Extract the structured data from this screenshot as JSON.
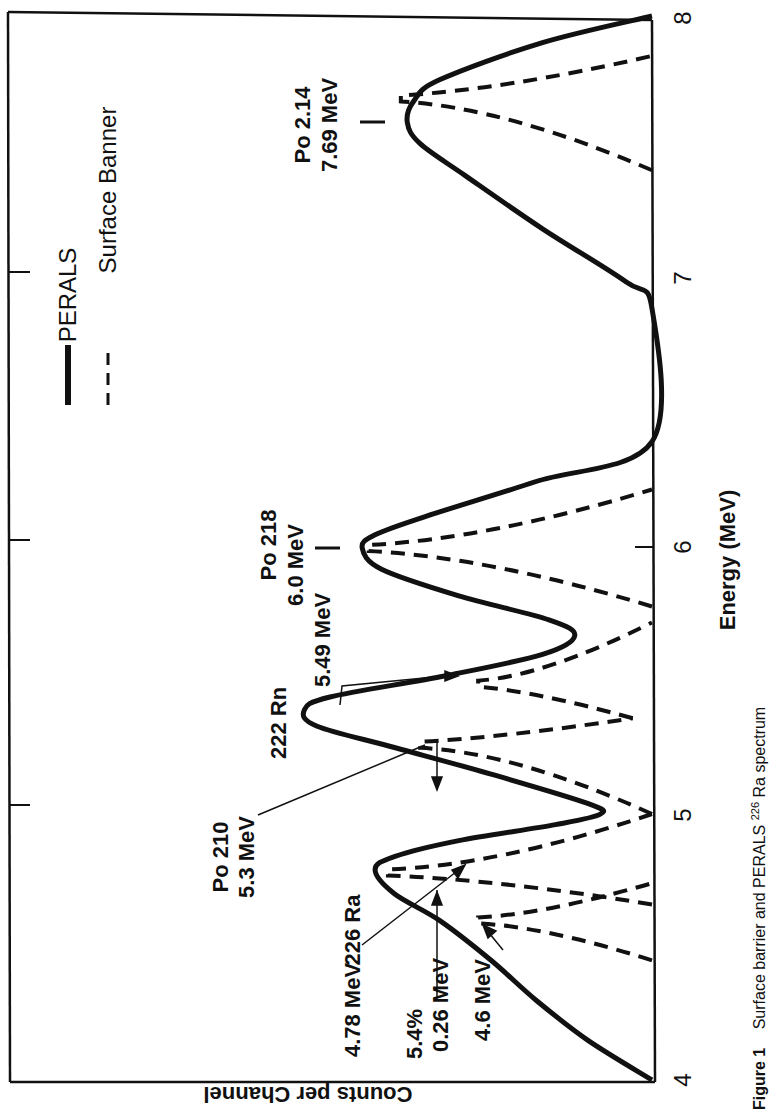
{
  "chart_data": {
    "type": "line",
    "orientation": "rotated-90-ccw",
    "title": "",
    "caption": {
      "figure_label": "Figure 1",
      "text": "Surface barrier and PERALS ",
      "superscript": "226",
      "text_after": "Ra spectrum"
    },
    "xlabel": "Energy (MeV)",
    "ylabel": "Counts per Channel",
    "xlim": [
      4,
      8
    ],
    "ylim": [
      0,
      100
    ],
    "y_units": "relative counts (no numeric ticks shown)",
    "x_ticks": [
      "4",
      "5",
      "6",
      "7",
      "8"
    ],
    "y_ticks_count": 3,
    "grid": false,
    "legend": {
      "position": "upper-left (rotated)",
      "entries": [
        {
          "label": "PERALS",
          "style": "solid"
        },
        {
          "label": "Surface Banner",
          "style": "dashed"
        }
      ]
    },
    "series": [
      {
        "name": "PERALS",
        "style": "solid",
        "points": [
          [
            4.0,
            0
          ],
          [
            4.15,
            10
          ],
          [
            4.3,
            18
          ],
          [
            4.45,
            25
          ],
          [
            4.6,
            33
          ],
          [
            4.7,
            40
          ],
          [
            4.79,
            43
          ],
          [
            4.84,
            40
          ],
          [
            4.9,
            30
          ],
          [
            4.96,
            15
          ],
          [
            5.0,
            8
          ],
          [
            5.04,
            10
          ],
          [
            5.15,
            25
          ],
          [
            5.25,
            40
          ],
          [
            5.33,
            52
          ],
          [
            5.39,
            54
          ],
          [
            5.44,
            50
          ],
          [
            5.52,
            32
          ],
          [
            5.6,
            17
          ],
          [
            5.67,
            12
          ],
          [
            5.73,
            16
          ],
          [
            5.82,
            30
          ],
          [
            5.92,
            42
          ],
          [
            6.0,
            45
          ],
          [
            6.05,
            43
          ],
          [
            6.12,
            35
          ],
          [
            6.25,
            18
          ],
          [
            6.4,
            0
          ],
          [
            6.9,
            0
          ],
          [
            7.0,
            4
          ],
          [
            7.2,
            17
          ],
          [
            7.4,
            29
          ],
          [
            7.52,
            36
          ],
          [
            7.6,
            38
          ],
          [
            7.68,
            37
          ],
          [
            7.76,
            33
          ],
          [
            7.9,
            17
          ],
          [
            8.0,
            0
          ]
        ]
      },
      {
        "name": "Surface Banner",
        "style": "dashed",
        "peaks": [
          {
            "center": 4.6,
            "height": 27,
            "left": 4.45,
            "right": 4.74
          },
          {
            "center": 4.78,
            "height": 41,
            "left": 4.66,
            "right": 5.0
          },
          {
            "center": 5.26,
            "height": 36,
            "left": 5.0,
            "right": 5.36,
            "right_height": 3
          },
          {
            "center": 5.49,
            "height": 27,
            "left": 5.36,
            "right": 5.72,
            "left_height": 3
          },
          {
            "center": 6.0,
            "height": 44,
            "left": 5.78,
            "right": 6.22
          },
          {
            "center": 7.69,
            "height": 39,
            "left": 7.42,
            "right": 7.85
          }
        ]
      }
    ],
    "annotations": [
      {
        "text": [
          "Po 2.14",
          "7.69 MeV"
        ],
        "energy": 7.69
      },
      {
        "text": [
          "Po 218",
          "6.0 MeV"
        ],
        "energy": 6.0
      },
      {
        "text": [
          "222 Rn",
          "5.49 MeV"
        ],
        "energy": 5.49
      },
      {
        "text": [
          "Po 210",
          "5.3 MeV"
        ],
        "energy": 5.3
      },
      {
        "text": [
          "226 Ra",
          "4.78 MeV"
        ],
        "energy": 4.78
      },
      {
        "text": [
          "5.4%",
          "0.26 MeV"
        ],
        "note": "FWHM of 226Ra peak"
      },
      {
        "text": [
          "4.6 MeV"
        ],
        "energy": 4.6
      }
    ]
  },
  "labels": {
    "legend_perals": "PERALS",
    "legend_sb": "Surface Banner",
    "xlabel": "Energy (MeV)",
    "ylabel": "Counts per Channel",
    "caption_fig": "Figure 1",
    "caption_text": "Surface barrier and PERALS ",
    "caption_sup": "226",
    "caption_after": "Ra spectrum",
    "ann_po214_a": "Po 2.14",
    "ann_po214_b": "7.69 MeV",
    "ann_po218_a": "Po 218",
    "ann_po218_b": "6.0 MeV",
    "ann_rn_a": "222 Rn",
    "ann_rn_b": "5.49 MeV",
    "ann_po210_a": "Po 210",
    "ann_po210_b": "5.3 MeV",
    "ann_ra_a": "226 Ra",
    "ann_ra_b": "4.78 MeV",
    "ann_fwhm_a": "5.4%",
    "ann_fwhm_b": "0.26 MeV",
    "ann_46": "4.6 MeV",
    "tick_4": "4",
    "tick_5": "5",
    "tick_6": "6",
    "tick_7": "7",
    "tick_8": "8"
  }
}
